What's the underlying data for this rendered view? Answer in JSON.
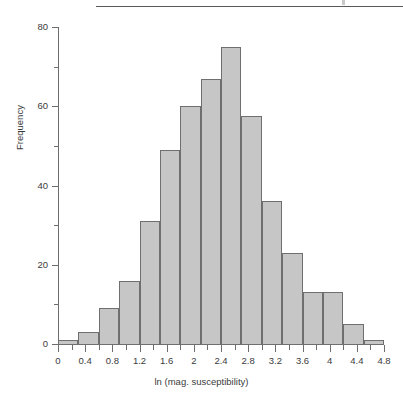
{
  "figure": {
    "background": "#ffffff",
    "rule_color": "#5a5a5a",
    "axis_color": "#6d6d6d",
    "bar_fill": "#c6c6c6",
    "bar_edge": "#6f6f6f"
  },
  "chart_data": {
    "type": "bar",
    "title": "",
    "subtitle": "",
    "xlabel": "ln (mag. susceptibility)",
    "ylabel": "Frequency",
    "xlim": [
      0,
      4.8
    ],
    "ylim": [
      0,
      80
    ],
    "grid": false,
    "legend": null,
    "bin_width": 0.3,
    "x_major_ticks": [
      0,
      0.4,
      0.8,
      1.2,
      1.6,
      2,
      2.4,
      2.8,
      3.2,
      3.6,
      4,
      4.4,
      4.8
    ],
    "x_major_tick_labels": [
      "0",
      "0.4",
      "0.8",
      "1.2",
      "1.6",
      "2",
      "2.4",
      "2.8",
      "3.2",
      "3.6",
      "4",
      "4.4",
      "4.8"
    ],
    "x_minor_ticks": [
      0.2,
      0.6,
      1.0,
      1.4,
      1.8,
      2.2,
      2.6,
      3.0,
      3.4,
      3.8,
      4.2,
      4.6
    ],
    "y_major_ticks": [
      0,
      20,
      40,
      60,
      80
    ],
    "y_major_tick_labels": [
      "0",
      "20",
      "40",
      "60",
      "80"
    ],
    "y_minor_ticks": [
      10,
      30,
      50,
      70
    ],
    "bins": [
      {
        "left": 0.0,
        "right": 0.3,
        "value": 1
      },
      {
        "left": 0.3,
        "right": 0.6,
        "value": 3
      },
      {
        "left": 0.6,
        "right": 0.9,
        "value": 9
      },
      {
        "left": 0.9,
        "right": 1.2,
        "value": 16
      },
      {
        "left": 1.2,
        "right": 1.5,
        "value": 31
      },
      {
        "left": 1.5,
        "right": 1.8,
        "value": 49
      },
      {
        "left": 1.8,
        "right": 2.1,
        "value": 60
      },
      {
        "left": 2.1,
        "right": 2.4,
        "value": 67
      },
      {
        "left": 2.4,
        "right": 2.7,
        "value": 75
      },
      {
        "left": 2.7,
        "right": 3.0,
        "value": 57.5
      },
      {
        "left": 3.0,
        "right": 3.3,
        "value": 36
      },
      {
        "left": 3.3,
        "right": 3.6,
        "value": 23
      },
      {
        "left": 3.6,
        "right": 3.9,
        "value": 13
      },
      {
        "left": 3.9,
        "right": 4.2,
        "value": 13
      },
      {
        "left": 4.2,
        "right": 4.5,
        "value": 5
      },
      {
        "left": 4.5,
        "right": 4.8,
        "value": 1
      }
    ],
    "categories": [
      "0.0-0.3",
      "0.3-0.6",
      "0.6-0.9",
      "0.9-1.2",
      "1.2-1.5",
      "1.5-1.8",
      "1.8-2.1",
      "2.1-2.4",
      "2.4-2.7",
      "2.7-3.0",
      "3.0-3.3",
      "3.3-3.6",
      "3.6-3.9",
      "3.9-4.2",
      "4.2-4.5",
      "4.5-4.8"
    ],
    "values": [
      1,
      3,
      9,
      16,
      31,
      49,
      60,
      67,
      75,
      57.5,
      36,
      23,
      13,
      13,
      5,
      1
    ]
  }
}
